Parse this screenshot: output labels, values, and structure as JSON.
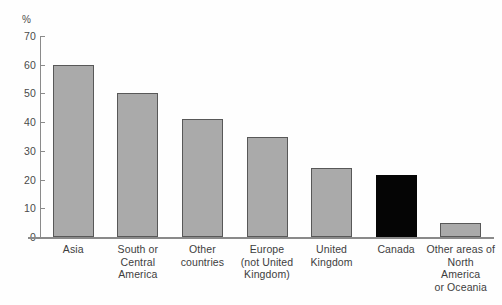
{
  "chart_data": {
    "type": "bar",
    "title": "",
    "subtitle": "",
    "xlabel": "",
    "ylabel": "",
    "unit_label": "%",
    "ylim": [
      0,
      70
    ],
    "yticks": [
      70,
      60,
      50,
      40,
      30,
      20,
      10,
      0
    ],
    "ytick_labels": [
      "70",
      "60",
      "50",
      "40",
      "30",
      "20",
      "10",
      "0"
    ],
    "grid": false,
    "legend": null,
    "categories": [
      "Asia",
      "South or Central America",
      "Other countries",
      "Europe (not United Kingdom)",
      "United Kingdom",
      "Canada",
      "Other areas of North America or Oceania"
    ],
    "category_lines": [
      [
        "Asia"
      ],
      [
        "South or",
        "Central",
        "America"
      ],
      [
        "Other",
        "countries"
      ],
      [
        "Europe",
        "(not United",
        "Kingdom)"
      ],
      [
        "United",
        "Kingdom"
      ],
      [
        "Canada"
      ],
      [
        "Other areas of",
        "North",
        "America",
        "or Oceania"
      ]
    ],
    "values": [
      60,
      50,
      41,
      35,
      24,
      21.5,
      5
    ],
    "bar_colors": [
      "#aaaaaa",
      "#aaaaaa",
      "#aaaaaa",
      "#aaaaaa",
      "#aaaaaa",
      "#050505",
      "#aaaaaa"
    ],
    "highlight_category": "Canada",
    "colors": {
      "bar_gray": "#aaaaaa",
      "bar_highlight": "#050505",
      "bar_border": "#585858",
      "axis": "#8a8a8a",
      "text": "#3d3d3d",
      "background": "#fefefe"
    }
  }
}
